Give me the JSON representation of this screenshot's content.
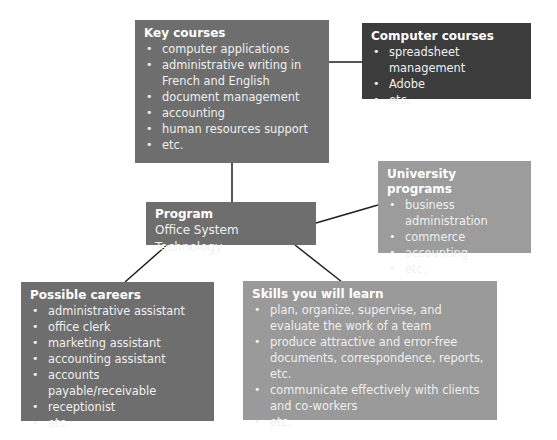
{
  "colors": {
    "key_courses_bg": "#6e6e6e",
    "computer_courses_bg": "#3c3c3c",
    "university_bg": "#9c9c9c",
    "program_bg": "#6e6e6e",
    "careers_bg": "#6e6e6e",
    "skills_bg": "#9a9a9a",
    "line": "#1e1e1e"
  },
  "key_courses": {
    "title": "Key courses",
    "items": [
      "computer applications",
      "administrative writing in French and English",
      "document management",
      "accounting",
      "human resources support",
      "etc."
    ]
  },
  "computer_courses": {
    "title": "Computer courses",
    "items": [
      "spreadsheet management",
      "Adobe",
      "etc."
    ]
  },
  "university_programs": {
    "title": "University programs",
    "items": [
      "business administration",
      "commerce",
      "accounting",
      "etc."
    ]
  },
  "program": {
    "title": "Program",
    "name": "Office System Technology"
  },
  "possible_careers": {
    "title": "Possible careers",
    "items": [
      "administrative assistant",
      "office clerk",
      "marketing assistant",
      "accounting assistant",
      "accounts payable/receivable",
      "receptionist",
      "etc."
    ]
  },
  "skills": {
    "title": "Skills you will learn",
    "items": [
      "plan, organize, supervise, and evaluate the work of a team",
      "produce attractive and error-free documents, correspondence, reports, etc.",
      "communicate effectively with clients and co-workers",
      "etc."
    ]
  }
}
